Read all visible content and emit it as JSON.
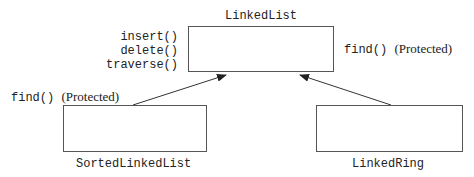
{
  "classes": {
    "base": {
      "name": "LinkedList",
      "public_methods": [
        "insert()",
        "delete()",
        "traverse()"
      ],
      "protected_method": "find()",
      "protected_label": "(Protected)"
    },
    "left_child": {
      "name": "SortedLinkedList",
      "protected_method": "find()",
      "protected_label": "(Protected)"
    },
    "right_child": {
      "name": "LinkedRing"
    }
  }
}
